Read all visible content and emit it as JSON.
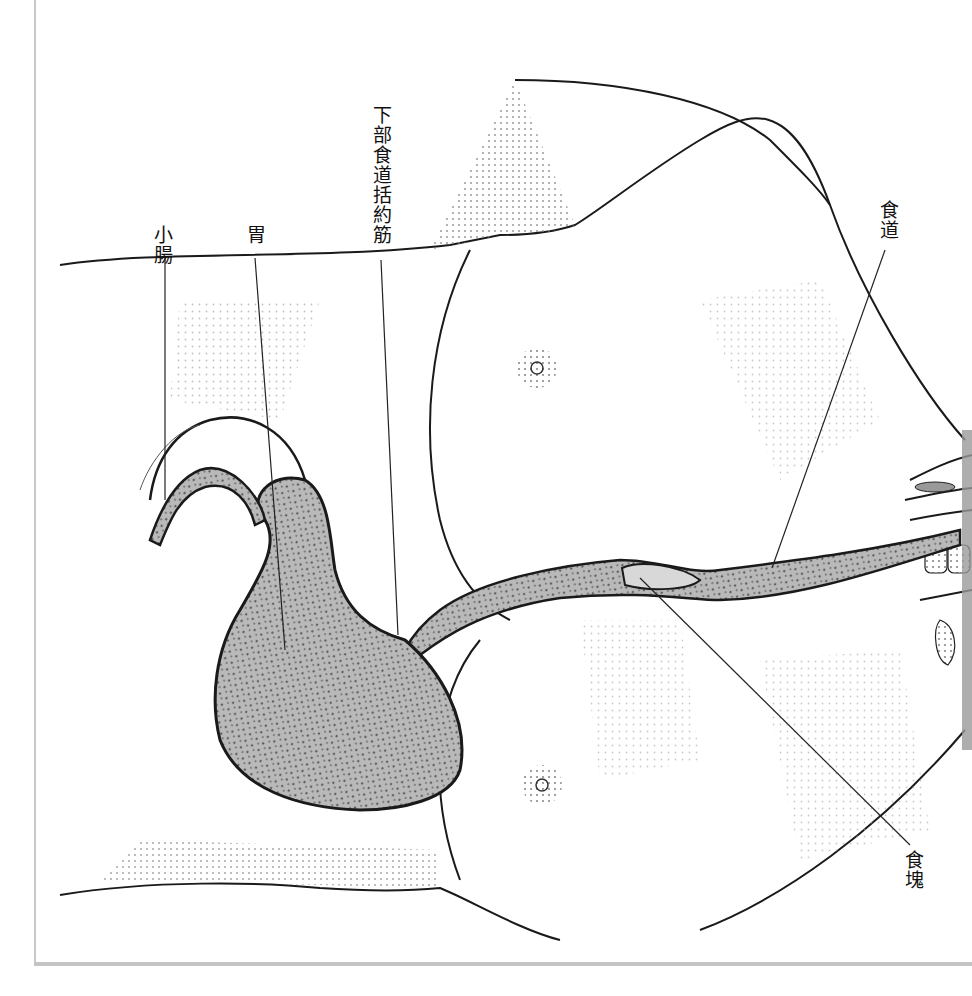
{
  "figure": {
    "type": "anatomical-illustration",
    "orientation": "rotated-90-clockwise",
    "colors": {
      "background": "#ffffff",
      "frame": "#c6c6c6",
      "outline": "#1a1a1a",
      "stipple": "#8a8a8a",
      "organ_fill": "#b9b9b9",
      "organ_texture": "#6e6e6e",
      "label_text": "#111111"
    }
  },
  "labels": {
    "esophagus": "食道",
    "lower_esophageal_sphincter": "下部食道括約筋",
    "stomach": "胃",
    "small_intestine": "小腸",
    "food_bolus": "食塊"
  }
}
